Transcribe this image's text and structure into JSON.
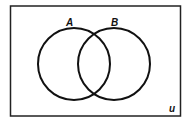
{
  "diagram": {
    "type": "venn",
    "universe_label": "u",
    "sets": [
      {
        "label": "A"
      },
      {
        "label": "B"
      }
    ],
    "colors": {
      "stroke": "#111111",
      "background": "#ffffff"
    }
  }
}
